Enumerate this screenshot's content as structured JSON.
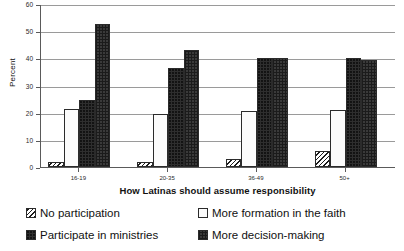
{
  "chart_data": {
    "type": "bar",
    "title": "",
    "xlabel": "How Latinas should assume responsibility",
    "ylabel": "Percent",
    "categories": [
      "16-19",
      "20-35",
      "36-49",
      "50+"
    ],
    "ylim": [
      0,
      60
    ],
    "yticks": [
      0,
      10,
      20,
      30,
      40,
      50,
      60
    ],
    "ytick_labels": [
      "0",
      "10",
      "20",
      "30",
      "40",
      "50",
      "60"
    ],
    "grid": true,
    "legend_position": "bottom",
    "series": [
      {
        "name": "No participation",
        "pattern": "diagonal-hatch",
        "values": [
          2,
          2,
          3,
          6
        ]
      },
      {
        "name": "More formation in the faith",
        "pattern": "light-dots",
        "values": [
          21.5,
          19.5,
          20.5,
          21
        ]
      },
      {
        "name": "Participate in ministries",
        "pattern": "solid-dark",
        "values": [
          24.5,
          36.5,
          40,
          40
        ]
      },
      {
        "name": "More decision-making",
        "pattern": "dark-checker",
        "values": [
          52.5,
          43,
          40,
          39.5
        ]
      }
    ]
  },
  "colors": {
    "axis": "#5a5a5a",
    "gridline": "#9a9a9a",
    "text": "#111111",
    "series_dark": "#2e2e2e",
    "series_light": "#fbfbfb",
    "background": "#ffffff"
  }
}
